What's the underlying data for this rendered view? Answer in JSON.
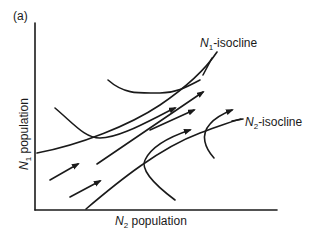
{
  "figure": {
    "panel_label": "(a)",
    "x_axis": {
      "var": "N",
      "sub": "2",
      "text": " population"
    },
    "y_axis": {
      "var": "N",
      "sub": "1",
      "text": " population"
    },
    "isoclines": [
      {
        "var": "N",
        "sub": "1",
        "text": "-isocline"
      },
      {
        "var": "N",
        "sub": "2",
        "text": "-isocline"
      }
    ],
    "colors": {
      "line": "#1a1a1a",
      "background": "#ffffff"
    }
  }
}
